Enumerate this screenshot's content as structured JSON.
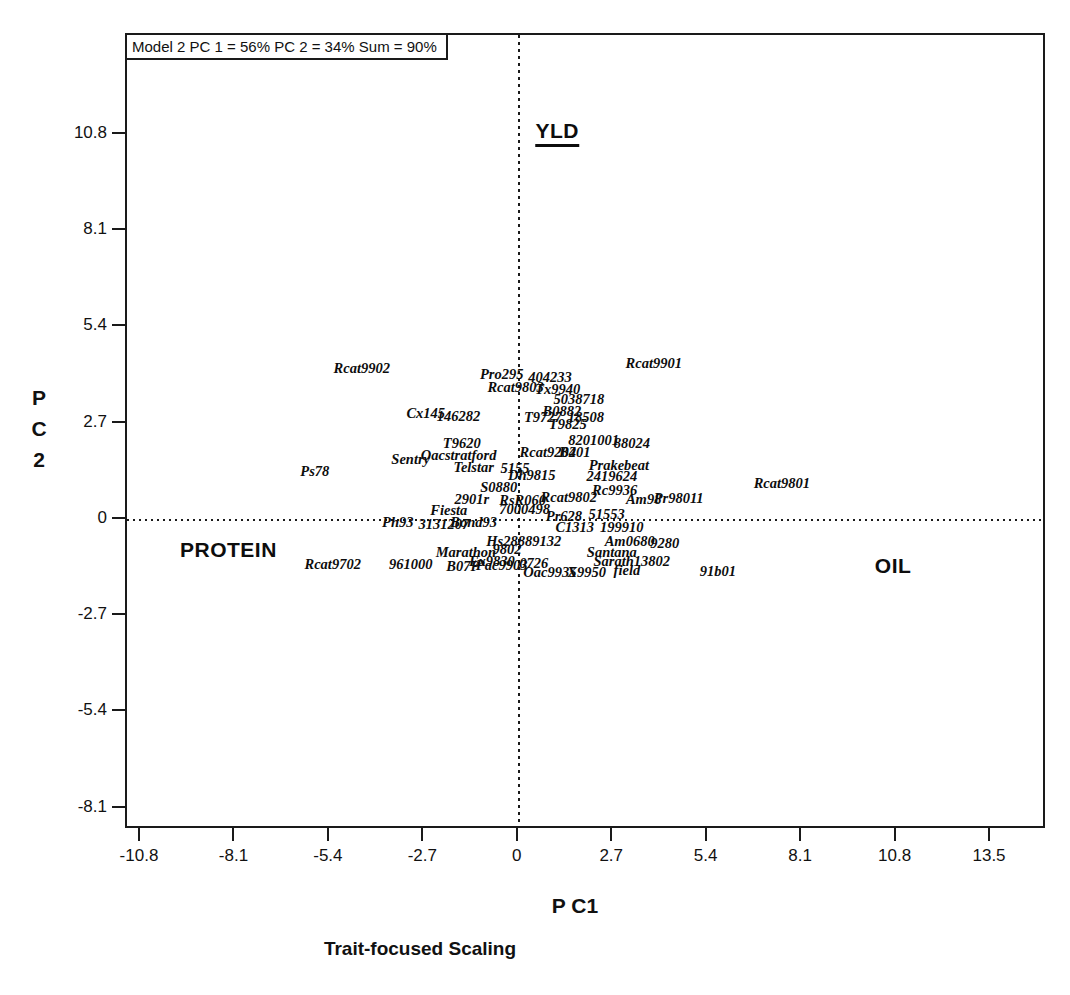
{
  "figure": {
    "model_summary": "Model 2 PC 1 = 56% PC 2 = 34% Sum = 90%",
    "x_axis_title": "P C1",
    "y_axis_title_lines": [
      "P",
      "C",
      "2"
    ],
    "caption": "Trait-focused Scaling"
  },
  "chart_data": {
    "type": "scatter",
    "title": "Model 2 PC 1 = 56% PC 2 = 34% Sum = 90%",
    "subtitle": "Trait-focused Scaling",
    "xlabel": "P C1",
    "ylabel": "P C 2",
    "xlim": [
      -11.2,
      15.1
    ],
    "ylim": [
      -8.7,
      13.6
    ],
    "x_ticks": [
      -10.8,
      -8.1,
      -5.4,
      -2.7,
      0,
      2.7,
      5.4,
      8.1,
      10.8,
      13.5
    ],
    "y_ticks": [
      10.8,
      8.1,
      5.4,
      2.7,
      0,
      -2.7,
      -5.4,
      -8.1
    ],
    "grid": "off",
    "zero_lines": "dotted",
    "legend": "none",
    "trait_vectors": [
      {
        "label": "YLD",
        "x": 1.1,
        "y": 10.85,
        "underline": true
      },
      {
        "label": "PROTEIN",
        "x": -8.3,
        "y": -0.85,
        "underline": false
      },
      {
        "label": "OIL",
        "x": 10.7,
        "y": -1.3,
        "underline": false
      }
    ],
    "points": [
      {
        "label": "Rcat9902",
        "x": -4.49,
        "y": 4.26
      },
      {
        "label": "Pro295",
        "x": -0.49,
        "y": 4.09
      },
      {
        "label": "404233",
        "x": 0.89,
        "y": 4.01
      },
      {
        "label": "Rcat9803",
        "x": -0.09,
        "y": 3.73
      },
      {
        "label": "Tx9940",
        "x": 1.11,
        "y": 3.67
      },
      {
        "label": "Rcat9901",
        "x": 3.86,
        "y": 4.4
      },
      {
        "label": "5038718",
        "x": 1.72,
        "y": 3.39
      },
      {
        "label": "B0882",
        "x": 1.23,
        "y": 3.06
      },
      {
        "label": "T9727",
        "x": 0.69,
        "y": 2.89
      },
      {
        "label": "18508",
        "x": 1.92,
        "y": 2.89
      },
      {
        "label": "T9825",
        "x": 1.4,
        "y": 2.69
      },
      {
        "label": "Cx145",
        "x": -2.66,
        "y": 3.0
      },
      {
        "label": "146282",
        "x": -1.72,
        "y": 2.92
      },
      {
        "label": "8201001",
        "x": 2.14,
        "y": 2.24
      },
      {
        "label": "88024",
        "x": 3.23,
        "y": 2.16
      },
      {
        "label": "T9620",
        "x": -1.63,
        "y": 2.16
      },
      {
        "label": "Sentry",
        "x": -3.09,
        "y": 1.71
      },
      {
        "label": "Oacstratford",
        "x": -1.72,
        "y": 1.82
      },
      {
        "label": "Rcat9204",
        "x": 0.83,
        "y": 1.91
      },
      {
        "label": "B201",
        "x": 1.6,
        "y": 1.91
      },
      {
        "label": "Telstar",
        "x": -1.29,
        "y": 1.49
      },
      {
        "label": "5155",
        "x": -0.11,
        "y": 1.46
      },
      {
        "label": "Prakebeat",
        "x": 2.86,
        "y": 1.54
      },
      {
        "label": "2419624",
        "x": 2.66,
        "y": 1.23
      },
      {
        "label": "Dh9815",
        "x": 0.37,
        "y": 1.26
      },
      {
        "label": "S0880",
        "x": -0.57,
        "y": 0.93
      },
      {
        "label": "Rc9936",
        "x": 2.74,
        "y": 0.84
      },
      {
        "label": "2901r",
        "x": -1.34,
        "y": 0.59
      },
      {
        "label": "RsR060",
        "x": 0.11,
        "y": 0.56
      },
      {
        "label": "Rcat9802",
        "x": 1.43,
        "y": 0.64
      },
      {
        "label": "Am98",
        "x": 3.57,
        "y": 0.59
      },
      {
        "label": "Pr98011",
        "x": 4.57,
        "y": 0.62
      },
      {
        "label": "Fiesta",
        "x": -2.0,
        "y": 0.28
      },
      {
        "label": "7000498",
        "x": 0.17,
        "y": 0.31
      },
      {
        "label": "Ph93",
        "x": -3.46,
        "y": -0.06
      },
      {
        "label": "3131207",
        "x": -2.14,
        "y": -0.11
      },
      {
        "label": "Bond93",
        "x": -1.29,
        "y": -0.06
      },
      {
        "label": "Pr628",
        "x": 1.29,
        "y": 0.11
      },
      {
        "label": "51553",
        "x": 2.51,
        "y": 0.17
      },
      {
        "label": "C1313",
        "x": 1.6,
        "y": -0.2
      },
      {
        "label": "199910",
        "x": 2.94,
        "y": -0.2
      },
      {
        "label": "Hs28889132",
        "x": 0.14,
        "y": -0.59
      },
      {
        "label": "Am0680",
        "x": 3.17,
        "y": -0.59
      },
      {
        "label": "9280",
        "x": 4.17,
        "y": -0.64
      },
      {
        "label": "Marathon",
        "x": -1.51,
        "y": -0.9
      },
      {
        "label": "9802",
        "x": -0.34,
        "y": -0.81
      },
      {
        "label": "Santana",
        "x": 2.66,
        "y": -0.9
      },
      {
        "label": "Rcat9702",
        "x": -5.32,
        "y": -1.23
      },
      {
        "label": "961000",
        "x": -3.09,
        "y": -1.23
      },
      {
        "label": "B07P",
        "x": -1.6,
        "y": -1.29
      },
      {
        "label": "Ex9830",
        "x": -0.77,
        "y": -1.15
      },
      {
        "label": "Pac9903",
        "x": -0.49,
        "y": -1.26
      },
      {
        "label": "0726",
        "x": 0.43,
        "y": -1.21
      },
      {
        "label": "Sarath13802",
        "x": 3.23,
        "y": -1.15
      },
      {
        "label": "Oac9935",
        "x": 0.89,
        "y": -1.46
      },
      {
        "label": "X9950",
        "x": 1.94,
        "y": -1.46
      },
      {
        "label": "field",
        "x": 3.09,
        "y": -1.4
      },
      {
        "label": "91b01",
        "x": 5.69,
        "y": -1.43
      },
      {
        "label": "Rcat9801",
        "x": 7.52,
        "y": 1.04
      },
      {
        "label": "Ps78",
        "x": -5.83,
        "y": 1.37
      }
    ]
  }
}
